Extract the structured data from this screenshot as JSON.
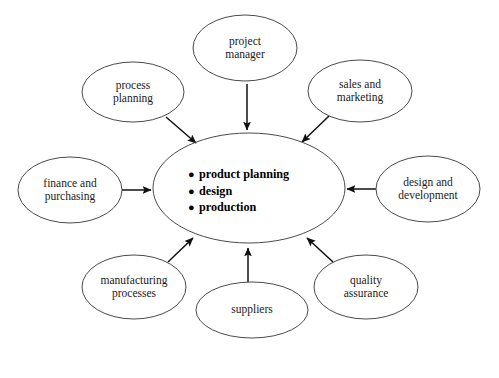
{
  "diagram": {
    "type": "hub-and-spoke",
    "stroke_color": "#4a4a4a",
    "arrow_color": "#111111",
    "background_color": "#ffffff",
    "center": {
      "name": "core-activities",
      "items": [
        "product planning",
        "design",
        "production"
      ],
      "bullet_glyph": "●",
      "cx": 249,
      "cy": 188,
      "rx": 96,
      "ry": 55
    },
    "satellites": [
      {
        "id": "project-manager",
        "lines": [
          "project",
          "manager"
        ],
        "cx": 245,
        "cy": 48,
        "rx": 52,
        "ry": 33,
        "arrow": {
          "direction": "down",
          "x1": 247,
          "y1": 84,
          "x2": 247,
          "y2": 130
        }
      },
      {
        "id": "process-planning",
        "lines": [
          "process",
          "planning"
        ],
        "cx": 133,
        "cy": 92,
        "rx": 51,
        "ry": 30,
        "arrow": {
          "direction": "down-right",
          "x1": 166,
          "y1": 117,
          "x2": 196,
          "y2": 143
        }
      },
      {
        "id": "sales-and-marketing",
        "lines": [
          "sales and",
          "marketing"
        ],
        "cx": 360,
        "cy": 91,
        "rx": 52,
        "ry": 31,
        "arrow": {
          "direction": "down-left",
          "x1": 329,
          "y1": 116,
          "x2": 302,
          "y2": 142
        }
      },
      {
        "id": "finance-and-purchasing",
        "lines": [
          "finance and",
          "purchasing"
        ],
        "cx": 70,
        "cy": 190,
        "rx": 52,
        "ry": 33,
        "arrow": {
          "direction": "right",
          "x1": 122,
          "y1": 190,
          "x2": 151,
          "y2": 190
        }
      },
      {
        "id": "design-and-development",
        "lines": [
          "design and",
          "development"
        ],
        "cx": 428,
        "cy": 189,
        "rx": 52,
        "ry": 33,
        "arrow": {
          "direction": "left",
          "x1": 376,
          "y1": 189,
          "x2": 347,
          "y2": 189
        }
      },
      {
        "id": "manufacturing-processes",
        "lines": [
          "manufacturing",
          "processes"
        ],
        "cx": 134,
        "cy": 287,
        "rx": 52,
        "ry": 32,
        "arrow": {
          "direction": "up-right",
          "x1": 168,
          "y1": 262,
          "x2": 193,
          "y2": 238
        }
      },
      {
        "id": "suppliers",
        "lines": [
          "suppliers"
        ],
        "cx": 252,
        "cy": 310,
        "rx": 56,
        "ry": 28,
        "arrow": {
          "direction": "up",
          "x1": 248,
          "y1": 282,
          "x2": 248,
          "y2": 248
        }
      },
      {
        "id": "quality-assurance",
        "lines": [
          "quality",
          "assurance"
        ],
        "cx": 366,
        "cy": 287,
        "rx": 52,
        "ry": 32,
        "arrow": {
          "direction": "up-left",
          "x1": 333,
          "y1": 262,
          "x2": 307,
          "y2": 238
        }
      }
    ]
  },
  "caption": {
    "text": ""
  }
}
